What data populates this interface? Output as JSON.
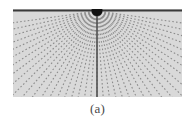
{
  "figure": {
    "panel_label": "(a)",
    "caption": "(a)",
    "colors": {
      "background": "#ffffff",
      "field_fill": "#d9d9d9",
      "boundary_line": "#3a3a3a",
      "ray_color": "#8c8c8c",
      "source_marker": "#111111",
      "axis_line": "#4f4f4f",
      "caption_text": "#4a4a4a"
    },
    "source_marker": {
      "name": "point-source",
      "cx": 84,
      "cy": 1,
      "r": 5.5
    },
    "field": {
      "x": 13,
      "y": 9,
      "width": 169,
      "height": 88
    },
    "boundary": {
      "name": "top-interface-line",
      "y": 1,
      "x1": 0,
      "x2": 169,
      "thickness": 2
    },
    "center_axis": {
      "name": "vertical-center-line",
      "x": 84,
      "y1": 4,
      "y2": 88,
      "thickness": 1.6
    },
    "rays": {
      "type": "radial-dotted-fan",
      "count": 41,
      "origin_x": 84,
      "origin_y": 2,
      "angle_start_deg": -82,
      "angle_end_deg": 82,
      "dash_pattern": "1.6 2.2",
      "stroke_width": 1.1,
      "length": 230
    }
  }
}
